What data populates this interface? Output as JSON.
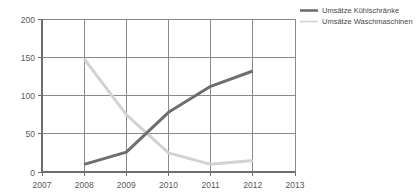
{
  "chart_data": {
    "type": "line",
    "title": "",
    "xlabel": "",
    "ylabel": "",
    "x": [
      2007,
      2008,
      2009,
      2010,
      2011,
      2012,
      2013
    ],
    "xlim": [
      2007,
      2013
    ],
    "ylim": [
      0,
      200
    ],
    "grid": true,
    "legend_position": "top-right",
    "x_tick_labels": [
      "2007",
      "2008",
      "2009",
      "2010",
      "2011",
      "2012",
      "2013"
    ],
    "y_ticks": [
      0,
      50,
      100,
      150,
      200
    ],
    "y_tick_labels": [
      "0",
      "50",
      "100",
      "150",
      "200"
    ],
    "series": [
      {
        "name": "Umsätze Kühlschränke",
        "color": "#6e6e70",
        "x": [
          2008,
          2009,
          2010,
          2011,
          2012
        ],
        "values": [
          10,
          26,
          78,
          112,
          132
        ]
      },
      {
        "name": "Umsätze Waschmaschinen",
        "color": "#d2d2d2",
        "x": [
          2008,
          2009,
          2010,
          2011,
          2012
        ],
        "values": [
          148,
          75,
          25,
          10,
          15
        ]
      }
    ]
  },
  "legend": {
    "items": [
      {
        "label": "Umsätze Kühlschränke",
        "color": "#6e6e70",
        "swatch": "thick-line-swatch"
      },
      {
        "label": "Umsätze Waschmaschinen",
        "color": "#d2d2d2",
        "swatch": "thin-line-swatch"
      }
    ]
  },
  "colors": {
    "axis": "#6e6e70",
    "grid": "#8a8a8c",
    "background": "#ffffff",
    "tick_text": "#59595b",
    "legend_text": "#4a4a4c"
  }
}
